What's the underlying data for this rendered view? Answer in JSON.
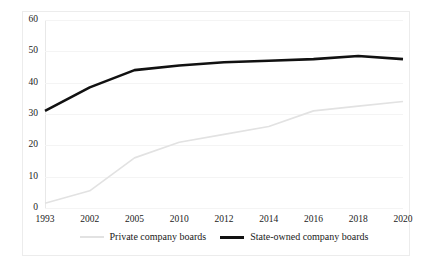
{
  "chart_data": {
    "type": "line",
    "title": "",
    "subtitle": "",
    "xlabel": "",
    "ylabel": "",
    "categories": [
      "1993",
      "2002",
      "2005",
      "2010",
      "2012",
      "2014",
      "2016",
      "2018",
      "2020"
    ],
    "series": [
      {
        "name": "Private company boards",
        "color": "#e2e2e2",
        "line_width": 1.6,
        "values": [
          1.5,
          5.5,
          16,
          21,
          23.5,
          26,
          31,
          32.5,
          34
        ]
      },
      {
        "name": "State-owned company boards",
        "color": "#111111",
        "line_width": 2.6,
        "values": [
          31,
          38.5,
          44,
          45.5,
          46.5,
          47,
          47.5,
          48.5,
          47.5
        ]
      }
    ],
    "ylim": [
      0,
      60
    ],
    "yticks": [
      0,
      10,
      20,
      30,
      40,
      50,
      60
    ],
    "ytick_labels": [
      "0",
      "10",
      "20",
      "30",
      "40",
      "50",
      "60"
    ],
    "grid": true,
    "grid_color": "#f4f4f4",
    "legend_position": "bottom-center",
    "frame_color": "#ececec",
    "background": "#ffffff"
  }
}
